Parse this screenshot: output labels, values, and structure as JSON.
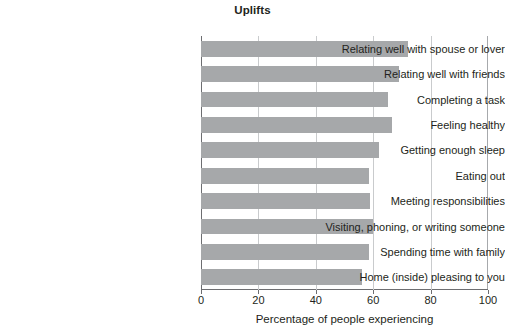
{
  "chart_data": {
    "type": "bar",
    "orientation": "horizontal",
    "title": "Uplifts",
    "xlabel": "Percentage of people experiencing",
    "ylabel": "",
    "xlim": [
      0,
      100
    ],
    "xticks": [
      0,
      20,
      40,
      60,
      80,
      100
    ],
    "xtick_labels": [
      "0",
      "20",
      "40",
      "60",
      "80",
      "100"
    ],
    "grid": "vertical",
    "legend": null,
    "bar_color": "#a6a8aa",
    "categories": [
      "Relating well with spouse or lover",
      "Relating well with friends",
      "Completing a task",
      "Feeling healthy",
      "Getting enough sleep",
      "Eating out",
      "Meeting responsibilities",
      "Visiting, phoning, or writing someone",
      "Spending time with family",
      "Home (inside) pleasing to you"
    ],
    "values": [
      72,
      69,
      65,
      66.5,
      62,
      58.5,
      59,
      60,
      58.5,
      56
    ]
  }
}
